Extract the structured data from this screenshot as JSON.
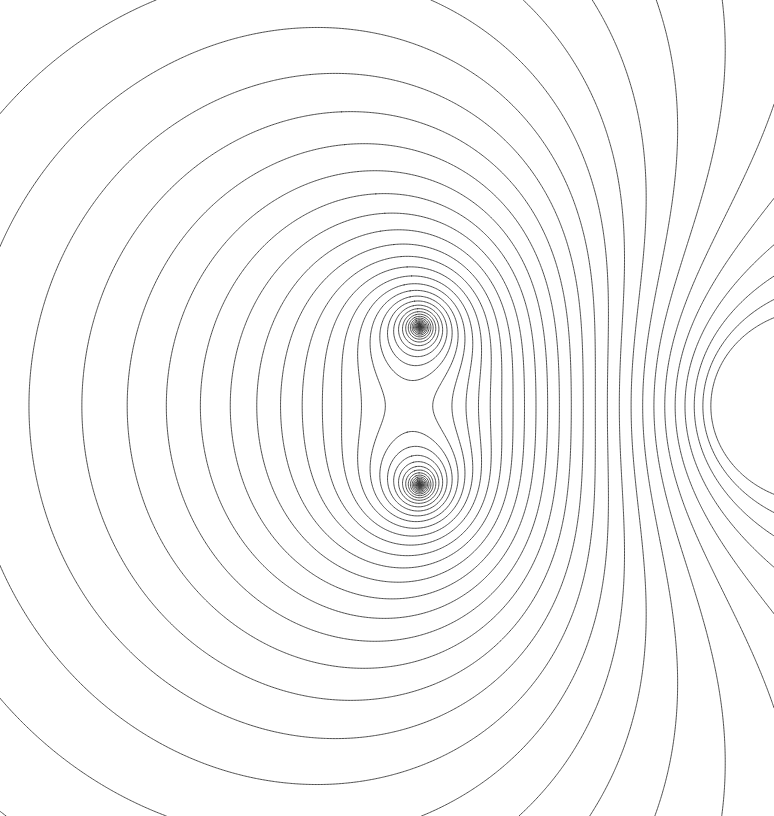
{
  "figure": {
    "kind": "contour-plot",
    "width": 774,
    "height": 816,
    "background_color": "#ffffff",
    "line_color": "#3a3a3a",
    "line_width": 0.9,
    "title": "",
    "axes_visible": false,
    "ticks_visible": false,
    "legend_visible": false
  },
  "chart_data": {
    "type": "line",
    "subtype": "contour-level-set",
    "title": "",
    "subtitle": "",
    "xlabel": "",
    "ylabel": "",
    "grid": false,
    "legend": "none",
    "xlim": [
      0,
      774
    ],
    "ylim": [
      0,
      816
    ],
    "description": "Level curves of a planar harmonic potential with three logarithmic singularities; nested ovals enclose the left focus pair, a lens-shaped family fills the gap between the two inner foci, a hyperbolic saddle sits to their right, and the remaining levels sweep outward as a divergent fan toward the upper-right and lower-right corners.",
    "symmetry_axis_y": 406,
    "singularities": [
      {
        "name": "upper-focus",
        "x": 420,
        "y": 327,
        "strength": 1.0
      },
      {
        "name": "lower-focus",
        "x": 420,
        "y": 485,
        "strength": 1.0
      },
      {
        "name": "right-focus",
        "x": 772,
        "y": 406,
        "strength": -1.15
      }
    ],
    "saddle_points": [
      {
        "name": "central-saddle",
        "x": 530,
        "y": 406
      }
    ],
    "contour_count": 46,
    "level_min": 0.04,
    "level_max": 3.05,
    "level_spacing": "geometric",
    "extents": {
      "left_lobe_outer_left_x": 4,
      "left_lobe_outer_top_y": 182,
      "left_lobe_outer_bottom_y": 630,
      "lens_half_width": 22
    },
    "series": [
      {
        "name": "nested-ovals-left",
        "contours": 28,
        "region": "x < 420"
      },
      {
        "name": "lens-between-foci",
        "contours": 14,
        "region": "x ~ 420, 327 < y < 485"
      },
      {
        "name": "saddle-and-fan-right",
        "contours": 30,
        "region": "x > 420"
      }
    ]
  },
  "accessibility": {
    "alt_text": "Dense black-on-white contour line drawing: concentric oval loops on the left converging to two cusp points at centre, with curves fanning out to the right edge."
  }
}
